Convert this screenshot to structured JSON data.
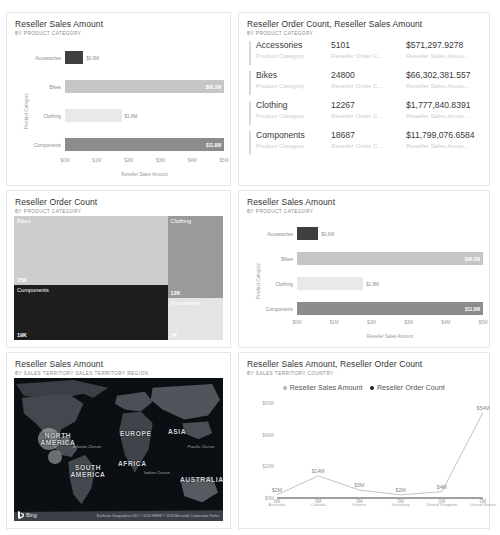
{
  "colors": {
    "accessories": "#3f3f3f",
    "bikes": "#c6c6c6",
    "clothing": "#e9e9e9",
    "components": "#8c8c8c",
    "treemap_bikes": "#cdcdcd",
    "treemap_components": "#1d1d1d",
    "treemap_clothing": "#9a9a9a",
    "treemap_accessories": "#e4e4e4",
    "line": "#a8a8a8"
  },
  "panels": {
    "bar_top_left": {
      "title": "Reseller Sales Amount",
      "subtitle": "BY PRODUCT CATEGORY"
    },
    "table": {
      "title": "Reseller Order Count, Reseller Sales Amount",
      "subtitle": "BY PRODUCT CATEGORY"
    },
    "treemap": {
      "title": "Reseller Order Count",
      "subtitle": "BY PRODUCT CATEGORY"
    },
    "bar_mid_right": {
      "title": "Reseller Sales Amount",
      "subtitle": "BY PRODUCT CATEGORY"
    },
    "map": {
      "title": "Reseller Sales Amount",
      "subtitle": "BY SALES TERRITORY SALES TERRITORY REGION",
      "provider": "Bing",
      "attribution": "Earthstar Geographics  SIO © 2016 HERE © 2016 Microsoft Corporation  Terms",
      "continents": [
        "NORTH AMERICA",
        "EUROPE",
        "ASIA",
        "AFRICA",
        "SOUTH AMERICA",
        "AUSTRALIA"
      ],
      "oceans": [
        "Atlantic Ocean",
        "Pacific Ocean",
        "Indian Ocean"
      ]
    },
    "combo": {
      "title": "Reseller Sales Amount, Reseller Order Count",
      "subtitle": "BY SALES TERRITORY COUNTRY"
    }
  },
  "chart_data": [
    {
      "type": "bar",
      "orientation": "horizontal",
      "title": "Reseller Sales Amount",
      "subtitle": "BY PRODUCT CATEGORY",
      "xlabel": "Reseller Sales Amount",
      "ylabel": "Product Category",
      "categories": [
        "Accessories",
        "Bikes",
        "Clothing",
        "Components"
      ],
      "values": [
        0.571,
        66.302,
        1.778,
        11.799
      ],
      "value_labels": [
        "$0.6M",
        "$66.3M",
        "$1.8M",
        "$11.8M"
      ],
      "label_inside": [
        false,
        true,
        false,
        true
      ],
      "xlim": [
        0,
        5
      ],
      "xticks": [
        "$0M",
        "$1M",
        "$2M",
        "$3M",
        "$4M",
        "$5M"
      ],
      "grid": false
    },
    {
      "type": "table",
      "title": "Reseller Order Count, Reseller Sales Amount",
      "subtitle": "BY PRODUCT CATEGORY",
      "columns": [
        "Product Category",
        "Reseller Order C...",
        "Reseller Sales Amou..."
      ],
      "rows": [
        {
          "category": "Accessories",
          "order_count": "5101",
          "sales_amount": "$571,297.9278"
        },
        {
          "category": "Bikes",
          "order_count": "24800",
          "sales_amount": "$66,302,381.557"
        },
        {
          "category": "Clothing",
          "order_count": "12267",
          "sales_amount": "$1,777,840.8391"
        },
        {
          "category": "Components",
          "order_count": "18687",
          "sales_amount": "$11,799,076.6584"
        }
      ]
    },
    {
      "type": "treemap",
      "title": "Reseller Order Count",
      "subtitle": "BY PRODUCT CATEGORY",
      "cells": [
        {
          "name": "Bikes",
          "label": "25K",
          "value": 24800
        },
        {
          "name": "Components",
          "label": "19K",
          "value": 18687
        },
        {
          "name": "Clothing",
          "label": "12K",
          "value": 12267
        },
        {
          "name": "Accessories",
          "label": "5K",
          "value": 5101
        }
      ]
    },
    {
      "type": "bar",
      "orientation": "horizontal",
      "title": "Reseller Sales Amount",
      "subtitle": "BY PRODUCT CATEGORY",
      "xlabel": "Reseller Sales Amount",
      "ylabel": "Product Category",
      "categories": [
        "Accessories",
        "Bikes",
        "Clothing",
        "Components"
      ],
      "values": [
        0.571,
        66.302,
        1.778,
        11.799
      ],
      "value_labels": [
        "$0.6M",
        "$66.3M",
        "$1.8M",
        "$11.8M"
      ],
      "label_inside": [
        false,
        true,
        false,
        true
      ],
      "xlim": [
        0,
        5
      ],
      "xticks": [
        "$0M",
        "$1M",
        "$2M",
        "$3M",
        "$4M",
        "$5M"
      ],
      "grid": false
    },
    {
      "type": "line",
      "title": "Reseller Sales Amount, Reseller Order Count",
      "subtitle": "BY SALES TERRITORY COUNTRY",
      "legend": [
        "Reseller Sales Amount",
        "Reseller Order Count"
      ],
      "legend_position": "top-center",
      "categories": [
        "Australia",
        "Canada",
        "France",
        "Germany",
        "United Kingdom",
        "United States"
      ],
      "series": [
        {
          "name": "Reseller Sales Amount",
          "values": [
            2,
            14,
            5,
            2,
            4,
            54
          ],
          "labels": [
            "$2M",
            "$14M",
            "$5M",
            "$2M",
            "$4M",
            "$54M"
          ]
        },
        {
          "name": "Reseller Order Count",
          "values": [
            0,
            0,
            0,
            0,
            0,
            0
          ],
          "labels": [
            "0M",
            "0M",
            "0M",
            "0M",
            "0M",
            "0M"
          ]
        }
      ],
      "ylim": [
        0,
        60
      ],
      "yticks": [
        "$0M",
        "$20M",
        "$40M",
        "$60M"
      ],
      "grid": false
    }
  ]
}
